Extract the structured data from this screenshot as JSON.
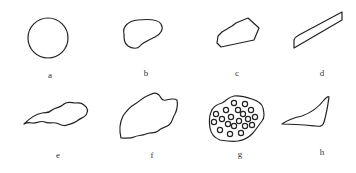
{
  "figure": {
    "panels": [
      {
        "id": "a",
        "label": "a",
        "shape": "circle"
      },
      {
        "id": "b",
        "label": "b",
        "shape": "rounded-irregular"
      },
      {
        "id": "c",
        "label": "c",
        "shape": "angular-polygon"
      },
      {
        "id": "d",
        "label": "d",
        "shape": "elongated-flat"
      },
      {
        "id": "e",
        "label": "e",
        "shape": "wavy-elongated"
      },
      {
        "id": "f",
        "label": "f",
        "shape": "irregular-wavy"
      },
      {
        "id": "g",
        "label": "g",
        "shape": "porous-with-holes"
      },
      {
        "id": "h",
        "label": "h",
        "shape": "triangular-sliver"
      }
    ],
    "stroke_color": "#222222",
    "background": "#ffffff"
  }
}
